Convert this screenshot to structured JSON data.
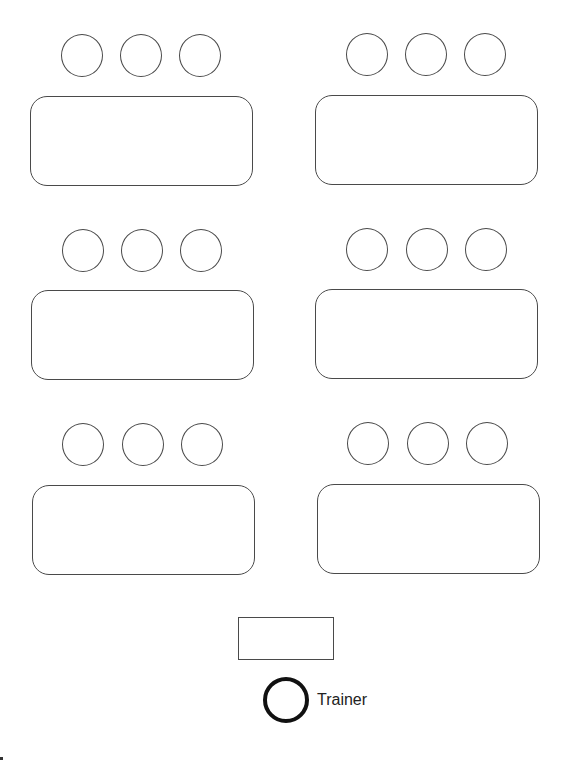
{
  "diagram": {
    "title": "",
    "type": "classroom seating layout",
    "colors": {
      "stroke": "#4a4a4a",
      "trainer_stroke": "#111111",
      "background": "#ffffff",
      "text": "#222222"
    },
    "groups": [
      {
        "id": "group-1",
        "position": "top-left",
        "seats": 3,
        "seat_boxes": [
          [
            61,
            34,
            42,
            43
          ],
          [
            120,
            34,
            42,
            43
          ],
          [
            179,
            34,
            42,
            43
          ]
        ],
        "table_box": [
          30,
          96,
          223,
          90
        ]
      },
      {
        "id": "group-2",
        "position": "top-right",
        "seats": 3,
        "seat_boxes": [
          [
            346,
            33,
            42,
            43
          ],
          [
            405,
            33,
            42,
            43
          ],
          [
            464,
            33,
            42,
            43
          ]
        ],
        "table_box": [
          315,
          95,
          223,
          90
        ]
      },
      {
        "id": "group-3",
        "position": "middle-left",
        "seats": 3,
        "seat_boxes": [
          [
            62,
            229,
            42,
            43
          ],
          [
            121,
            229,
            42,
            43
          ],
          [
            180,
            229,
            42,
            43
          ]
        ],
        "table_box": [
          31,
          290,
          223,
          90
        ]
      },
      {
        "id": "group-4",
        "position": "middle-right",
        "seats": 3,
        "seat_boxes": [
          [
            346,
            228,
            42,
            43
          ],
          [
            406,
            228,
            42,
            43
          ],
          [
            465,
            228,
            42,
            43
          ]
        ],
        "table_box": [
          315,
          289,
          223,
          90
        ]
      },
      {
        "id": "group-5",
        "position": "bottom-left",
        "seats": 3,
        "seat_boxes": [
          [
            62,
            423,
            42,
            43
          ],
          [
            122,
            423,
            42,
            43
          ],
          [
            181,
            423,
            42,
            43
          ]
        ],
        "table_box": [
          32,
          485,
          223,
          90
        ]
      },
      {
        "id": "group-6",
        "position": "bottom-right",
        "seats": 3,
        "seat_boxes": [
          [
            347,
            422,
            42,
            43
          ],
          [
            407,
            422,
            42,
            43
          ],
          [
            466,
            422,
            42,
            43
          ]
        ],
        "table_box": [
          317,
          484,
          223,
          90
        ]
      }
    ],
    "trainer": {
      "label": "Trainer",
      "desk_box": [
        238,
        617,
        96,
        43
      ],
      "seat_box": [
        263,
        677,
        46,
        46
      ]
    }
  }
}
